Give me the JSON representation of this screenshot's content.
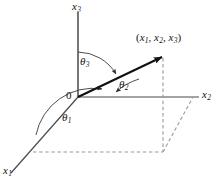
{
  "figure": {
    "type": "vector-direction-cosines-diagram",
    "background_color": "#ffffff",
    "line_color": "#3a3a3a",
    "vector_color": "#111111",
    "dash_color": "#8a8a8a",
    "axes": [
      {
        "id": "x1",
        "name": "x1-axis",
        "label_base": "x",
        "label_sub": "1",
        "label_x": 4,
        "label_y": 166,
        "direction": "down-left"
      },
      {
        "id": "x2",
        "name": "x2-axis",
        "label_base": "x",
        "label_sub": "2",
        "label_x": 201,
        "label_y": 90,
        "direction": "right"
      },
      {
        "id": "x3",
        "name": "x3-axis",
        "label_base": "x",
        "label_sub": "3",
        "label_x": 73,
        "label_y": 2,
        "direction": "up"
      }
    ],
    "origin": {
      "label": "0",
      "x": 66,
      "y": 90
    },
    "point_label": {
      "parts": [
        "(",
        "x",
        "1",
        ", ",
        "x",
        "2",
        ", ",
        "x",
        "3",
        ")"
      ],
      "text": "(x1, x2, x3)",
      "x": 136,
      "y": 33
    },
    "angles": [
      {
        "id": "theta1",
        "name": "angle-theta1",
        "label_base": "θ",
        "label_sub": "1",
        "label_x": 62,
        "label_y": 113,
        "between": [
          "vector",
          "x1-axis"
        ]
      },
      {
        "id": "theta2",
        "name": "angle-theta2",
        "label_base": "θ",
        "label_sub": "2",
        "label_x": 119,
        "label_y": 80,
        "between": [
          "vector",
          "x2-axis"
        ]
      },
      {
        "id": "theta3",
        "name": "angle-theta3",
        "label_base": "θ",
        "label_sub": "3",
        "label_x": 80,
        "label_y": 57,
        "between": [
          "vector",
          "x3-axis"
        ]
      }
    ],
    "vector": {
      "name": "position-vector",
      "from_x": 78,
      "from_y": 97,
      "to_x": 164,
      "to_y": 56
    },
    "projection_box": {
      "name": "projection-parallelogram",
      "vertices": [
        [
          33,
          152
        ],
        [
          163,
          152
        ],
        [
          193,
          97
        ],
        [
          78,
          97
        ]
      ],
      "style": "dashed"
    }
  }
}
